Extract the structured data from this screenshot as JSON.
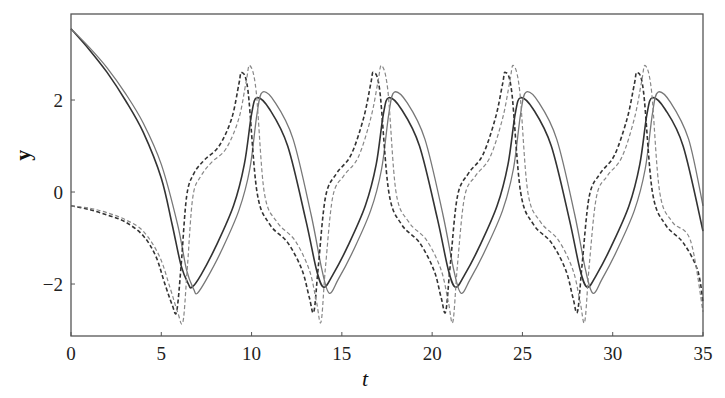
{
  "chart_data": {
    "type": "line",
    "title": "",
    "xlabel": "t",
    "ylabel": "y",
    "xlim": [
      0,
      35
    ],
    "ylim": [
      -3.13,
      3.87
    ],
    "xticks": [
      0,
      5,
      10,
      15,
      20,
      25,
      30,
      35
    ],
    "xtick_labels": [
      "0",
      "5",
      "10",
      "15",
      "20",
      "25",
      "30",
      "35"
    ],
    "yticks": [
      -2,
      0,
      2
    ],
    "ytick_labels": [
      "−2",
      "0",
      "2"
    ],
    "grid": false,
    "legend": null,
    "series": [
      {
        "name": "solid-dark",
        "style": "solid",
        "color": "#333333",
        "width": 1.6,
        "t": [
          0,
          1,
          2,
          3,
          4,
          5,
          5.6,
          6.1,
          6.5,
          6.7,
          7.2,
          8,
          9,
          9.6,
          10.0,
          10.3,
          11,
          12,
          13,
          13.6,
          14.0,
          14.5,
          15.3,
          16.3,
          16.9,
          17.3,
          17.6,
          18.3,
          19.3,
          20.3,
          20.9,
          21.3,
          21.8,
          22.6,
          23.6,
          24.2,
          24.6,
          24.9,
          25.6,
          26.6,
          27.6,
          28.2,
          28.6,
          29.1,
          29.9,
          30.9,
          31.5,
          31.9,
          32.2,
          32.9,
          33.9,
          35
        ],
        "y": [
          3.55,
          3.1,
          2.6,
          2.0,
          1.3,
          0.3,
          -0.7,
          -1.6,
          -2.0,
          -2.07,
          -1.8,
          -1.2,
          -0.3,
          0.6,
          1.7,
          2.05,
          1.8,
          1.0,
          -0.6,
          -1.7,
          -2.07,
          -1.8,
          -1.2,
          -0.3,
          0.6,
          1.7,
          2.05,
          1.8,
          1.0,
          -0.6,
          -1.7,
          -2.07,
          -1.8,
          -1.2,
          -0.3,
          0.6,
          1.7,
          2.05,
          1.8,
          1.0,
          -0.6,
          -1.7,
          -2.07,
          -1.8,
          -1.2,
          -0.3,
          0.6,
          1.7,
          2.05,
          1.8,
          1.0,
          -0.85
        ]
      },
      {
        "name": "solid-light",
        "style": "solid",
        "color": "#777777",
        "width": 1.3,
        "t": [
          0,
          1,
          2,
          3,
          4,
          5,
          5.9,
          6.4,
          6.8,
          7.0,
          7.5,
          8.3,
          9.3,
          9.9,
          10.3,
          10.6,
          11.3,
          12.3,
          13.3,
          13.9,
          14.3,
          14.8,
          15.6,
          16.6,
          17.2,
          17.6,
          17.9,
          18.6,
          19.6,
          20.6,
          21.2,
          21.6,
          22.1,
          22.9,
          23.9,
          24.5,
          24.9,
          25.2,
          25.9,
          26.9,
          27.9,
          28.5,
          28.9,
          29.4,
          30.2,
          31.2,
          31.8,
          32.2,
          32.5,
          33.2,
          34.2,
          35
        ],
        "y": [
          3.55,
          3.15,
          2.7,
          2.15,
          1.5,
          0.6,
          -0.7,
          -1.7,
          -2.12,
          -2.2,
          -1.9,
          -1.3,
          -0.4,
          0.5,
          1.7,
          2.17,
          1.95,
          1.15,
          -0.5,
          -1.7,
          -2.2,
          -1.9,
          -1.3,
          -0.4,
          0.5,
          1.7,
          2.17,
          1.95,
          1.15,
          -0.5,
          -1.7,
          -2.2,
          -1.9,
          -1.3,
          -0.4,
          0.5,
          1.7,
          2.17,
          1.95,
          1.15,
          -0.5,
          -1.7,
          -2.2,
          -1.9,
          -1.3,
          -0.4,
          0.5,
          1.7,
          2.17,
          1.95,
          1.15,
          -0.3
        ]
      },
      {
        "name": "dashed-dark",
        "style": "dashed",
        "color": "#333333",
        "width": 1.6,
        "t": [
          0,
          1,
          2,
          3,
          4,
          4.7,
          5.2,
          5.6,
          5.85,
          6.1,
          6.4,
          6.8,
          7.4,
          8.2,
          8.9,
          9.3,
          9.45,
          9.8,
          10.3,
          11.0,
          12.0,
          12.8,
          13.2,
          13.45,
          13.7,
          14.1,
          14.7,
          15.5,
          16.2,
          16.6,
          16.75,
          17.1,
          17.6,
          18.3,
          19.3,
          20.1,
          20.5,
          20.75,
          21.0,
          21.4,
          22.0,
          22.8,
          23.5,
          23.9,
          24.05,
          24.4,
          24.9,
          25.6,
          26.6,
          27.4,
          27.8,
          28.05,
          28.3,
          28.7,
          29.3,
          30.1,
          30.8,
          31.2,
          31.35,
          31.7,
          32.2,
          32.9,
          33.9,
          34.7,
          35
        ],
        "y": [
          -0.3,
          -0.38,
          -0.5,
          -0.65,
          -0.95,
          -1.4,
          -2.0,
          -2.45,
          -2.6,
          -1.6,
          -0.1,
          0.4,
          0.7,
          1.0,
          1.6,
          2.35,
          2.6,
          2.2,
          0.0,
          -0.7,
          -1.1,
          -1.7,
          -2.3,
          -2.6,
          -1.6,
          -0.1,
          0.4,
          0.8,
          1.6,
          2.35,
          2.6,
          2.2,
          0.0,
          -0.7,
          -1.1,
          -1.7,
          -2.3,
          -2.6,
          -1.6,
          -0.1,
          0.4,
          0.8,
          1.6,
          2.35,
          2.6,
          2.2,
          0.0,
          -0.7,
          -1.1,
          -1.7,
          -2.3,
          -2.6,
          -1.6,
          -0.1,
          0.4,
          0.8,
          1.6,
          2.35,
          2.6,
          2.2,
          0.0,
          -0.7,
          -1.1,
          -1.7,
          -2.4
        ]
      },
      {
        "name": "dashed-light",
        "style": "dashed",
        "color": "#888888",
        "width": 1.2,
        "t": [
          0,
          1,
          2,
          3,
          4,
          4.9,
          5.5,
          5.9,
          6.2,
          6.45,
          6.75,
          7.2,
          7.8,
          8.6,
          9.3,
          9.7,
          9.9,
          10.25,
          10.7,
          11.4,
          12.4,
          13.2,
          13.6,
          13.85,
          14.1,
          14.5,
          15.1,
          15.9,
          16.6,
          17.0,
          17.2,
          17.55,
          18.0,
          18.7,
          19.7,
          20.5,
          20.9,
          21.15,
          21.4,
          21.8,
          22.4,
          23.2,
          23.9,
          24.3,
          24.5,
          24.85,
          25.3,
          26.0,
          27.0,
          27.8,
          28.2,
          28.45,
          28.7,
          29.1,
          29.7,
          30.5,
          31.2,
          31.6,
          31.8,
          32.15,
          32.6,
          33.3,
          34.3,
          35
        ],
        "y": [
          -0.3,
          -0.35,
          -0.45,
          -0.6,
          -0.85,
          -1.4,
          -2.1,
          -2.6,
          -2.82,
          -1.6,
          -0.1,
          0.35,
          0.65,
          0.95,
          1.6,
          2.4,
          2.75,
          2.2,
          0.0,
          -0.65,
          -1.05,
          -1.7,
          -2.4,
          -2.82,
          -1.6,
          -0.1,
          0.35,
          0.75,
          1.6,
          2.4,
          2.75,
          2.2,
          0.0,
          -0.65,
          -1.05,
          -1.7,
          -2.4,
          -2.82,
          -1.6,
          -0.1,
          0.35,
          0.75,
          1.6,
          2.4,
          2.75,
          2.2,
          0.0,
          -0.65,
          -1.05,
          -1.7,
          -2.4,
          -2.82,
          -1.6,
          -0.1,
          0.35,
          0.75,
          1.6,
          2.4,
          2.75,
          2.2,
          0.0,
          -0.65,
          -1.05,
          -2.6
        ]
      }
    ]
  },
  "plot_area": {
    "left": 71,
    "top": 14,
    "right": 703,
    "bottom": 336
  }
}
